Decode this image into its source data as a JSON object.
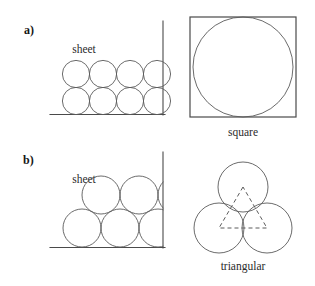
{
  "figure": {
    "background_color": "#ffffff",
    "stroke_color": "#5a5a5a",
    "wall_color": "#4a4a4a",
    "text_color": "#1a1a1a"
  },
  "panels": [
    {
      "id": "a",
      "letter": "a)",
      "letter_pos": {
        "x": 24,
        "y": 34
      },
      "sheet": {
        "label": "sheet",
        "label_pos": {
          "x": 84,
          "y": 53
        },
        "walls": [
          {
            "name": "vertical-wall",
            "x1": 163,
            "y1": 21,
            "x2": 163,
            "y2": 115
          },
          {
            "name": "horizontal-wall",
            "x1": 50,
            "y1": 114.5,
            "x2": 165,
            "y2": 114.5
          }
        ],
        "packing": "square",
        "circle_radius": 13.6,
        "circles": [
          {
            "cx": 76,
            "cy": 74
          },
          {
            "cx": 103,
            "cy": 74
          },
          {
            "cx": 130,
            "cy": 74
          },
          {
            "cx": 157,
            "cy": 74
          },
          {
            "cx": 76,
            "cy": 101
          },
          {
            "cx": 103,
            "cy": 101
          },
          {
            "cx": 130,
            "cy": 101
          },
          {
            "cx": 157,
            "cy": 101
          }
        ]
      },
      "unit_cell": {
        "label": "square",
        "label_pos": {
          "x": 243,
          "y": 136
        },
        "shape": "square",
        "box": {
          "x": 190,
          "y": 17,
          "width": 106,
          "height": 100
        },
        "circle": {
          "cx": 243,
          "cy": 67,
          "r": 50
        }
      }
    },
    {
      "id": "b",
      "letter": "b)",
      "letter_pos": {
        "x": 23,
        "y": 164
      },
      "sheet": {
        "label": "sheet",
        "label_pos": {
          "x": 84,
          "y": 183
        },
        "walls": [
          {
            "name": "vertical-wall",
            "x1": 163,
            "y1": 152,
            "x2": 163,
            "y2": 248
          },
          {
            "name": "horizontal-wall",
            "x1": 50,
            "y1": 247.5,
            "x2": 165,
            "y2": 247.5
          }
        ],
        "packing": "hexagonal",
        "circle_radius": 19,
        "circles": [
          {
            "cx": 82,
            "cy": 228
          },
          {
            "cx": 120,
            "cy": 228
          },
          {
            "cx": 158,
            "cy": 228
          },
          {
            "cx": 101,
            "cy": 195
          },
          {
            "cx": 139,
            "cy": 195
          },
          {
            "cx": 177,
            "cy": 195
          }
        ]
      },
      "unit_cell": {
        "label": "triangular",
        "label_pos": {
          "x": 243,
          "y": 270
        },
        "shape": "triangular",
        "circle_radius": 25,
        "circles": [
          {
            "cx": 243,
            "cy": 187
          },
          {
            "cx": 219,
            "cy": 228
          },
          {
            "cx": 267,
            "cy": 228
          }
        ],
        "triangle_points": "243,187 219,228 267,228"
      }
    }
  ]
}
